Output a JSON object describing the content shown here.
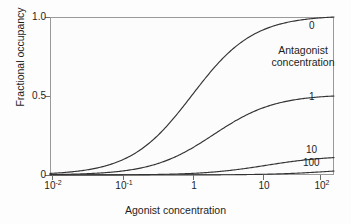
{
  "chart_data": {
    "type": "line",
    "title": "",
    "xlabel": "Agonist concentration",
    "ylabel": "Fractional occupancy",
    "xscale": "log",
    "xlim": [
      0.01,
      100
    ],
    "ylim": [
      0,
      1.0
    ],
    "grid": false,
    "legend_position": "inside-right",
    "legend_title": "Antagonist concentration",
    "x_tick_labels": [
      "10⁻²",
      "10⁻¹",
      "1",
      "10",
      "10²"
    ],
    "x_tick_values": [
      0.01,
      0.1,
      1,
      10,
      100
    ],
    "y_tick_labels": [
      "1.0",
      "0.5",
      "0"
    ],
    "y_tick_values": [
      1.0,
      0.5,
      0
    ],
    "series": [
      {
        "name": "0",
        "label": "0",
        "antagonist_concentration": 0,
        "plateau": 1.0,
        "ec50": 1,
        "x": [
          0.01,
          0.02,
          0.05,
          0.1,
          0.2,
          0.5,
          1,
          2,
          5,
          10,
          20,
          50,
          100
        ],
        "values": [
          0.01,
          0.02,
          0.048,
          0.091,
          0.167,
          0.333,
          0.5,
          0.667,
          0.833,
          0.909,
          0.952,
          0.98,
          0.99
        ]
      },
      {
        "name": "1",
        "label": "1",
        "antagonist_concentration": 1,
        "plateau": 0.5,
        "ec50": 2,
        "x": [
          0.01,
          0.02,
          0.05,
          0.1,
          0.2,
          0.5,
          1,
          2,
          5,
          10,
          20,
          50,
          100
        ],
        "values": [
          0.005,
          0.01,
          0.024,
          0.048,
          0.091,
          0.2,
          0.333,
          0.5,
          0.714,
          0.833,
          0.909,
          0.962,
          0.98
        ]
      },
      {
        "name": "10",
        "label": "10",
        "antagonist_concentration": 10,
        "plateau": 0.11,
        "ec50": 11,
        "x": [
          0.01,
          0.02,
          0.05,
          0.1,
          0.2,
          0.5,
          1,
          2,
          5,
          10,
          20,
          50,
          100
        ],
        "values": [
          0.001,
          0.002,
          0.005,
          0.009,
          0.018,
          0.043,
          0.083,
          0.154,
          0.313,
          0.476,
          0.645,
          0.82,
          0.901
        ]
      },
      {
        "name": "100",
        "label": "100",
        "antagonist_concentration": 100,
        "plateau": 0.025,
        "ec50": 101,
        "x": [
          0.01,
          0.02,
          0.05,
          0.1,
          0.2,
          0.5,
          1,
          2,
          5,
          10,
          20,
          50,
          100
        ],
        "values": [
          0.0001,
          0.0002,
          0.0005,
          0.001,
          0.002,
          0.005,
          0.01,
          0.019,
          0.047,
          0.09,
          0.165,
          0.331,
          0.498
        ]
      }
    ],
    "curve_color": "#333333",
    "frame_color": "#9a9a9a",
    "background_color": "#fcfcfc"
  },
  "axes": {
    "y_title": "Fractional occupancy",
    "x_title": "Agonist concentration",
    "y_ticks": [
      {
        "label": "1.0",
        "value": 1.0
      },
      {
        "label": "0.5",
        "value": 0.5
      },
      {
        "label": "0",
        "value": 0
      }
    ],
    "x_ticks": [
      {
        "mantissa": "10",
        "exponent": "-2",
        "value": 0.01
      },
      {
        "mantissa": "10",
        "exponent": "-1",
        "value": 0.1
      },
      {
        "mantissa": "1",
        "exponent": "",
        "value": 1
      },
      {
        "mantissa": "10",
        "exponent": "",
        "value": 10
      },
      {
        "mantissa": "10",
        "exponent": "2",
        "value": 100
      }
    ]
  },
  "legend": {
    "title_line1": "Antagonist",
    "title_line2": "concentration",
    "curve_labels": [
      "0",
      "1",
      "10",
      "100"
    ]
  }
}
